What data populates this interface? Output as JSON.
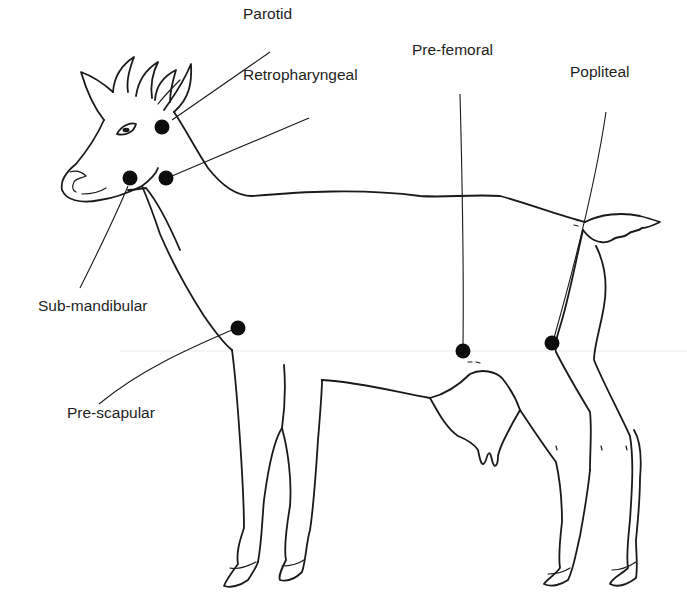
{
  "diagram": {
    "topic": "Lymph node locations",
    "colors": {
      "ink": "#1a1a1a",
      "node_fill": "#0d0d0d",
      "background": "#ffffff"
    },
    "labels": [
      {
        "id": "parotid",
        "text": "Parotid",
        "x": 243,
        "y": 6,
        "node": [
          162,
          127
        ]
      },
      {
        "id": "retropharyngeal",
        "text": "Retropharyngeal",
        "x": 243,
        "y": 67,
        "node": [
          166,
          178
        ]
      },
      {
        "id": "sub-mandibular",
        "text": "Sub-mandibular",
        "x": 38,
        "y": 298,
        "node": [
          130,
          178
        ]
      },
      {
        "id": "pre-scapular",
        "text": "Pre-scapular",
        "x": 67,
        "y": 405,
        "node": [
          238,
          328
        ]
      },
      {
        "id": "pre-femoral",
        "text": "Pre-femoral",
        "x": 412,
        "y": 42,
        "node": [
          463,
          351
        ]
      },
      {
        "id": "popliteal",
        "text": "Popliteal",
        "x": 570,
        "y": 64,
        "node": [
          552,
          343
        ]
      }
    ]
  }
}
